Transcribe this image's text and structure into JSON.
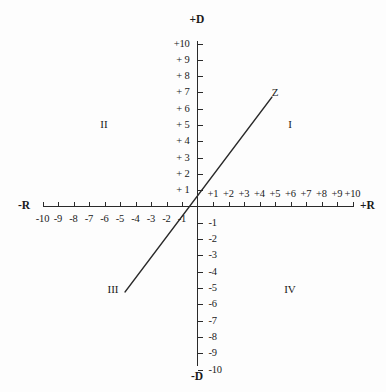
{
  "figure": {
    "title_visible": false,
    "background_color": "#fdfdfd",
    "ink_color": "#1a1a1a"
  },
  "chart_data": {
    "type": "line",
    "title": "",
    "xlabel": "+R",
    "ylabel": "+D",
    "xlabel_negative": "-R",
    "ylabel_negative": "-D",
    "xlim": [
      -10,
      10
    ],
    "ylim": [
      -10,
      10
    ],
    "grid": false,
    "legend": "none",
    "axis_style": "cartesian-crosshair-with-ticks",
    "x_ticks": [
      -10,
      -9,
      -8,
      -7,
      -6,
      -5,
      -4,
      -3,
      -2,
      -1,
      1,
      2,
      3,
      4,
      5,
      6,
      7,
      8,
      9,
      10
    ],
    "y_ticks": [
      10,
      9,
      8,
      7,
      6,
      5,
      4,
      3,
      2,
      1,
      -1,
      -2,
      -3,
      -4,
      -5,
      -6,
      -7,
      -8,
      -9,
      -10
    ],
    "x_tick_labels_negative": [
      "-10",
      "-9",
      "-8",
      "-7",
      "-6",
      "-5",
      "-4",
      "-3",
      "-2",
      "-1"
    ],
    "x_tick_labels_positive": [
      "+1",
      "+2",
      "+3",
      "+4",
      "+5",
      "+6",
      "+7",
      "+8",
      "+9",
      "+10"
    ],
    "y_tick_labels_positive": [
      "+10",
      "+ 9",
      "+ 8",
      "+ 7",
      "+ 6",
      "+ 5",
      "+ 4",
      "+ 3",
      "+ 2",
      "+ 1"
    ],
    "y_tick_labels_negative": [
      "-1",
      "-2",
      "-3",
      "-4",
      "-5",
      "-6",
      "-7",
      "-8",
      "-9",
      "-10"
    ],
    "series": [
      {
        "name": "Z",
        "label": "Z",
        "type": "line",
        "through_origin": true,
        "slope": 1.15,
        "x": [
          -3.1,
          6.1
        ],
        "y": [
          -3.6,
          7.0
        ],
        "label_position": {
          "x": 6.3,
          "y": 7.9
        }
      }
    ],
    "annotations": [
      {
        "text": "I",
        "x": 7.0,
        "y": 5.2,
        "role": "quadrant-label"
      },
      {
        "text": "II",
        "x": -6.2,
        "y": 5.2,
        "role": "quadrant-label"
      },
      {
        "text": "III",
        "x": -6.2,
        "y": -5.2,
        "role": "quadrant-label"
      },
      {
        "text": "IV",
        "x": 7.0,
        "y": -5.2,
        "role": "quadrant-label"
      }
    ]
  },
  "labels": {
    "axis_top": "+D",
    "axis_bottom": "-D",
    "axis_left": "-R",
    "axis_right": "+R",
    "quadrant_i": "I",
    "quadrant_ii": "II",
    "quadrant_iii": "III",
    "quadrant_iv": "IV",
    "line_z": "Z"
  },
  "y_positive": [
    {
      "label": "+10",
      "value": 10
    },
    {
      "label": "+ 9",
      "value": 9
    },
    {
      "label": "+ 8",
      "value": 8
    },
    {
      "label": "+ 7",
      "value": 7
    },
    {
      "label": "+ 6",
      "value": 6
    },
    {
      "label": "+ 5",
      "value": 5
    },
    {
      "label": "+ 4",
      "value": 4
    },
    {
      "label": "+ 3",
      "value": 3
    },
    {
      "label": "+ 2",
      "value": 2
    },
    {
      "label": "+ 1",
      "value": 1
    }
  ],
  "y_negative": [
    {
      "label": "-1",
      "value": -1
    },
    {
      "label": "-2",
      "value": -2
    },
    {
      "label": "-3",
      "value": -3
    },
    {
      "label": "-4",
      "value": -4
    },
    {
      "label": "-5",
      "value": -5
    },
    {
      "label": "-6",
      "value": -6
    },
    {
      "label": "-7",
      "value": -7
    },
    {
      "label": "-8",
      "value": -8
    },
    {
      "label": "-9",
      "value": -9
    },
    {
      "label": "-10",
      "value": -10
    }
  ],
  "x_negative": [
    {
      "label": "-10",
      "value": -10
    },
    {
      "label": "-9",
      "value": -9
    },
    {
      "label": "-8",
      "value": -8
    },
    {
      "label": "-7",
      "value": -7
    },
    {
      "label": "-6",
      "value": -6
    },
    {
      "label": "-5",
      "value": -5
    },
    {
      "label": "-4",
      "value": -4
    },
    {
      "label": "-3",
      "value": -3
    },
    {
      "label": "-2",
      "value": -2
    },
    {
      "label": "-1",
      "value": -1
    }
  ],
  "x_positive": [
    {
      "label": "+1",
      "value": 1
    },
    {
      "label": "+2",
      "value": 2
    },
    {
      "label": "+3",
      "value": 3
    },
    {
      "label": "+4",
      "value": 4
    },
    {
      "label": "+5",
      "value": 5
    },
    {
      "label": "+6",
      "value": 6
    },
    {
      "label": "+7",
      "value": 7
    },
    {
      "label": "+8",
      "value": 8
    },
    {
      "label": "+9",
      "value": 9
    },
    {
      "label": "+10",
      "value": 10
    }
  ]
}
